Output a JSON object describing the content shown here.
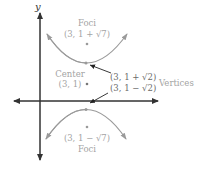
{
  "diagram": {
    "axes": {
      "y_label": "y"
    },
    "labels": {
      "foci_top": "Foci",
      "focus_top_coord": "(3, 1 + √7)",
      "center": "Center",
      "center_coord": "(3, 1)",
      "vertex_top_coord": "(3, 1 + √2)",
      "vertex_bottom_coord": "(3, 1 − √2)",
      "vertices": "Vertices",
      "focus_bottom_coord": "(3, 1 − √7)",
      "foci_bottom": "Foci"
    },
    "colors": {
      "curve": "#9a9a9a",
      "axis": "#333333",
      "text": "#a3a3a3",
      "pointer": "#222222"
    }
  }
}
